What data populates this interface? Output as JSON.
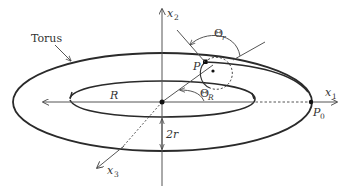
{
  "diagram": {
    "labels": {
      "torus": "Torus",
      "x1": "x",
      "x1_sub": "1",
      "x2": "x",
      "x2_sub": "2",
      "x3": "x",
      "x3_sub": "3",
      "R": "R",
      "two_r": "2r",
      "P": "P",
      "P0": "P",
      "P0_sub": "0",
      "theta_r": "Θ",
      "theta_r_sub": "r",
      "theta_R": "Θ",
      "theta_R_sub": "R"
    },
    "colors": {
      "line": "#333333",
      "axis": "#555555",
      "background": "#ffffff"
    }
  }
}
